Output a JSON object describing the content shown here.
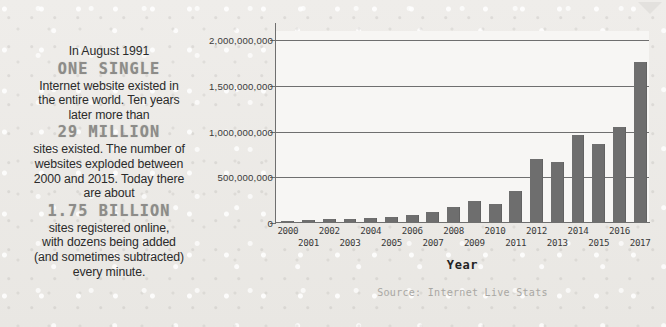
{
  "background_color": "#eceae7",
  "callout": {
    "bubble_icon": "speech-bubble-icon",
    "lines": [
      {
        "text": "In August 1991",
        "style": "normal"
      },
      {
        "text": "ONE SINGLE",
        "style": "big"
      },
      {
        "text": "Internet website existed in",
        "style": "normal"
      },
      {
        "text": "the entire world. Ten years",
        "style": "normal"
      },
      {
        "text": "later more than",
        "style": "normal"
      },
      {
        "text": "29 MILLION",
        "style": "big"
      },
      {
        "text": "sites existed. The number of",
        "style": "normal"
      },
      {
        "text": "websites exploded between",
        "style": "normal"
      },
      {
        "text": "2000 and 2015. Today there",
        "style": "normal"
      },
      {
        "text": "are about",
        "style": "normal"
      },
      {
        "text": "1.75 BILLION",
        "style": "big"
      },
      {
        "text": "sites registered online,",
        "style": "normal"
      },
      {
        "text": "with dozens being added",
        "style": "normal"
      },
      {
        "text": "(and sometimes subtracted)",
        "style": "normal"
      },
      {
        "text": "every minute.",
        "style": "normal"
      }
    ],
    "highlight_color": "#8d8c89",
    "text_color": "#2b2b2b"
  },
  "chart_data": {
    "type": "bar",
    "title": "",
    "xlabel": "Year",
    "ylabel": "",
    "source": "Source: Internet Live Stats",
    "categories": [
      "2000",
      "2001",
      "2002",
      "2003",
      "2004",
      "2005",
      "2006",
      "2007",
      "2008",
      "2009",
      "2010",
      "2011",
      "2012",
      "2013",
      "2014",
      "2015",
      "2016",
      "2017"
    ],
    "values": [
      17000000,
      29000000,
      39000000,
      40000000,
      51000000,
      64000000,
      85000000,
      121000000,
      172000000,
      238000000,
      206000000,
      346000000,
      697000000,
      672000000,
      968000000,
      863000000,
      1045000000,
      1766000000
    ],
    "ylim": [
      0,
      2100000000
    ],
    "ytick_values": [
      0,
      500000000,
      1000000000,
      1500000000,
      2000000000
    ],
    "ytick_labels": [
      "0",
      "500,000,000",
      "1,000,000,000",
      "1,500,000,000",
      "2,000,000,000"
    ],
    "grid": true,
    "grid_axis": "y",
    "legend": false,
    "bar_color": "#6e6e6e",
    "axis_color": "#6f6f6f",
    "plot_background": "#f7f6f4"
  }
}
